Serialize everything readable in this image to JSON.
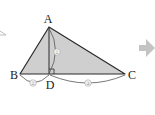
{
  "figure": {
    "type": "geometry-triangle-with-altitude",
    "vertices": {
      "A": {
        "label": "A",
        "x": 49,
        "y": 27
      },
      "B": {
        "label": "B",
        "x": 20,
        "y": 74
      },
      "C": {
        "label": "C",
        "x": 125,
        "y": 74
      },
      "D": {
        "label": "D",
        "x": 49,
        "y": 74
      }
    },
    "segment_marks": {
      "AD": "①",
      "BD": "②",
      "DC": "③"
    },
    "right_angle_at": "D",
    "colors": {
      "fill": "#cfcfcf",
      "stroke": "#2a2a2a",
      "mark": "#9a9a9a",
      "arrow": "#c4c4c4"
    }
  },
  "decor": {
    "next_arrow_icon": "right-arrow-icon",
    "partial_triangle_icon": "partial-triangle-icon"
  }
}
